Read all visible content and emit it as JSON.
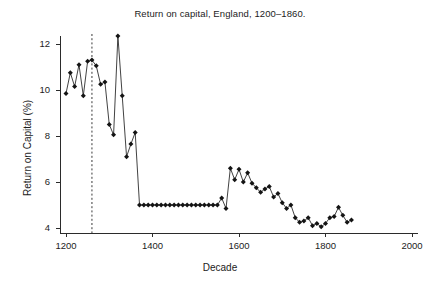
{
  "chart_data": {
    "type": "line",
    "title": "Return on capital, England, 1200–1860.",
    "xlabel": "Decade",
    "ylabel": "Return on Capital (%)",
    "xlim": [
      1150,
      2000
    ],
    "ylim": [
      3.6,
      12.6
    ],
    "xticks": [
      1200,
      1400,
      1600,
      1800,
      2000
    ],
    "yticks": [
      4,
      6,
      8,
      10,
      12
    ],
    "grid": false,
    "legend": null,
    "marker": "diamond",
    "line_color": "#2d2d2d",
    "marker_color": "#141414",
    "annotations": [
      {
        "type": "vline",
        "x": 1260,
        "style": "dashed",
        "color": "#3a3a3a"
      }
    ],
    "series": [
      {
        "name": "Return on capital",
        "x": [
          1200,
          1210,
          1220,
          1230,
          1240,
          1250,
          1260,
          1270,
          1280,
          1290,
          1300,
          1310,
          1320,
          1330,
          1340,
          1350,
          1360,
          1370,
          1380,
          1390,
          1400,
          1410,
          1420,
          1430,
          1440,
          1450,
          1460,
          1470,
          1480,
          1490,
          1500,
          1510,
          1520,
          1530,
          1540,
          1550,
          1560,
          1570,
          1580,
          1590,
          1600,
          1610,
          1620,
          1630,
          1640,
          1650,
          1660,
          1670,
          1680,
          1690,
          1700,
          1710,
          1720,
          1730,
          1740,
          1750,
          1760,
          1770,
          1780,
          1790,
          1800,
          1810,
          1820,
          1830,
          1840,
          1850,
          1860
        ],
        "y": [
          9.85,
          10.75,
          10.15,
          11.1,
          9.75,
          11.25,
          11.3,
          11.05,
          10.25,
          10.35,
          8.5,
          8.05,
          12.35,
          9.75,
          7.1,
          7.65,
          8.15,
          5.0,
          5.0,
          5.0,
          5.0,
          5.0,
          5.0,
          5.0,
          5.0,
          5.0,
          5.0,
          5.0,
          5.0,
          5.0,
          5.0,
          5.0,
          5.0,
          5.0,
          5.0,
          5.0,
          5.3,
          4.85,
          6.6,
          6.1,
          6.55,
          6.0,
          6.4,
          5.95,
          5.75,
          5.55,
          5.7,
          5.8,
          5.35,
          5.5,
          5.1,
          4.85,
          5.0,
          4.45,
          4.25,
          4.3,
          4.45,
          4.1,
          4.2,
          4.05,
          4.2,
          4.45,
          4.5,
          4.9,
          4.55,
          4.25,
          4.35
        ]
      }
    ]
  },
  "axis": {
    "y_tick_labels": [
      "4",
      "6",
      "8",
      "10",
      "12"
    ],
    "x_tick_labels": [
      "1200",
      "1400",
      "1600",
      "1800",
      "2000"
    ]
  }
}
